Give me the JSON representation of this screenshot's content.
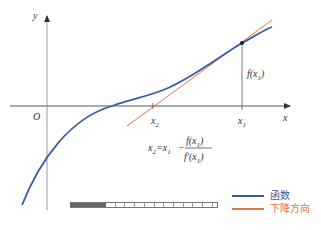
{
  "diagram": {
    "axes": {
      "x_label": "x",
      "y_label": "y",
      "origin_label": "O"
    },
    "points": {
      "x1_label": "x",
      "x1_sub": "1",
      "x2_label": "x",
      "x2_sub": "2",
      "fx1_label": "f(x",
      "fx1_sub": "1",
      "fx1_close": ")"
    },
    "formula": {
      "lhs": "x",
      "lhs_sub": "2",
      "eq": "=x",
      "eq_sub": "1",
      "minus": "−",
      "num": "f(x",
      "num_sub": "1",
      "num_close": ")",
      "den": "f′(x",
      "den_sub": "1",
      "den_close": ")"
    },
    "colors": {
      "function_curve": "#3a5da8",
      "tangent_line": "#e8704a",
      "axis": "#444444",
      "guide": "#555555"
    }
  },
  "legend": {
    "items": [
      {
        "label": "函数",
        "color": "#3a5da8"
      },
      {
        "label": "下降方向",
        "color": "#e8704a"
      }
    ]
  },
  "scrubber": {
    "progress_percent": 24
  }
}
